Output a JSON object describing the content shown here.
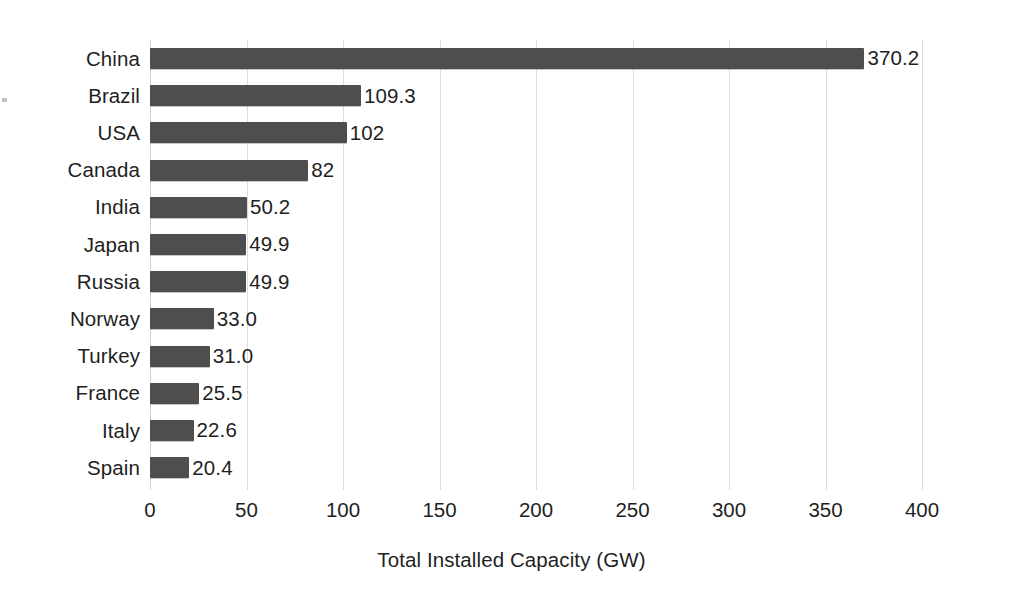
{
  "chart_data": {
    "type": "bar",
    "orientation": "horizontal",
    "title": "",
    "subtitle": "",
    "xlabel": "Total Installed Capacity (GW)",
    "ylabel": "",
    "categories": [
      "China",
      "Brazil",
      "USA",
      "Canada",
      "India",
      "Japan",
      "Russia",
      "Norway",
      "Turkey",
      "France",
      "Italy",
      "Spain"
    ],
    "values": [
      370.2,
      109.3,
      102,
      82,
      50.2,
      49.9,
      49.9,
      33.0,
      31.0,
      25.5,
      22.6,
      20.4
    ],
    "value_labels": [
      "370.2",
      "109.3",
      "102",
      "82",
      "50.2",
      "49.9",
      "49.9",
      "33.0",
      "31.0",
      "25.5",
      "22.6",
      "20.4"
    ],
    "xlim": [
      0,
      400
    ],
    "xticks": [
      0,
      50,
      100,
      150,
      200,
      250,
      300,
      350,
      400
    ],
    "xtick_labels": [
      "0",
      "50",
      "100",
      "150",
      "200",
      "250",
      "300",
      "350",
      "400"
    ],
    "grid": true,
    "grid_axis": "x",
    "legend": null,
    "bar_color": "#4e4e4e",
    "grid_color": "#dcdcdc",
    "text_color": "#1f1f1f",
    "background_color": "#ffffff"
  }
}
